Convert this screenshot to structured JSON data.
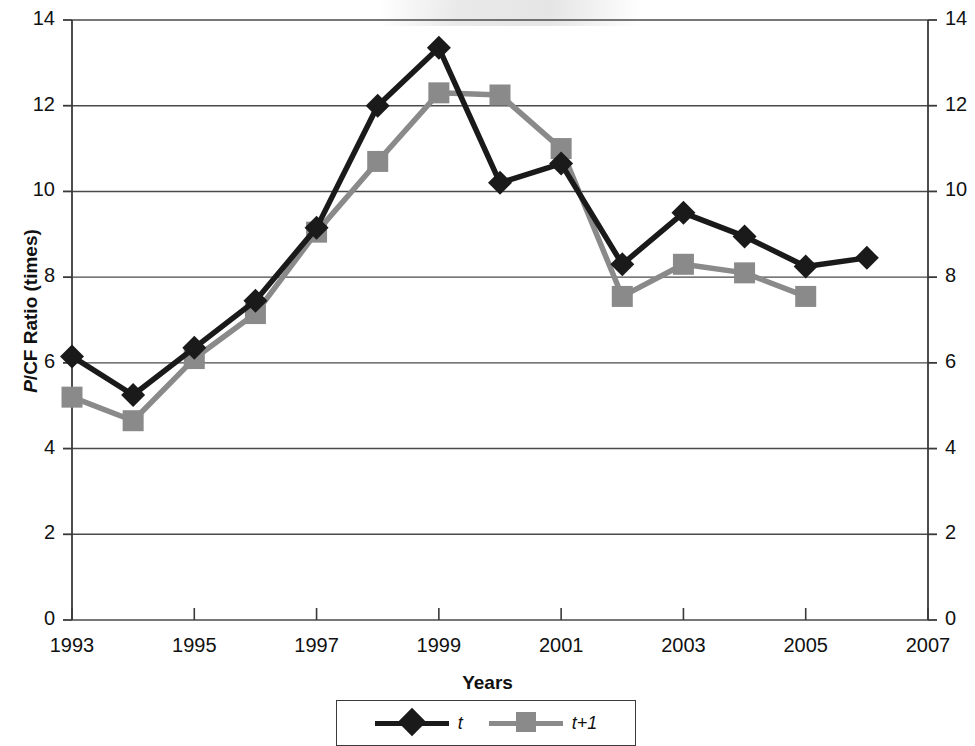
{
  "chart_data": {
    "type": "line",
    "title": "",
    "xlabel": "Years",
    "ylabel": "P/CF Ratio (times)",
    "ylabel_italic_prefix": "P",
    "ylabel_rest": "/CF Ratio (times)",
    "xlim": [
      1993,
      2007
    ],
    "ylim": [
      0,
      14
    ],
    "x_ticks": [
      1993,
      1995,
      1997,
      1999,
      2001,
      2003,
      2005,
      2007
    ],
    "x_tick_labels": [
      "1993",
      "1995",
      "1997",
      "1999",
      "2001",
      "2003",
      "2005",
      "2007"
    ],
    "y_ticks": [
      0,
      2,
      4,
      6,
      8,
      10,
      12,
      14
    ],
    "y_tick_labels": [
      "0",
      "2",
      "4",
      "6",
      "8",
      "10",
      "12",
      "14"
    ],
    "y_ticks_right": [
      0,
      2,
      4,
      6,
      8,
      10,
      12,
      14
    ],
    "y_tick_labels_right": [
      "0",
      "2",
      "4",
      "6",
      "8",
      "10",
      "12",
      "14"
    ],
    "grid": true,
    "grid_axis": "y",
    "legend_position": "bottom-center",
    "x": [
      1993,
      1994,
      1995,
      1996,
      1997,
      1998,
      1999,
      2000,
      2001,
      2002,
      2003,
      2004,
      2005,
      2006
    ],
    "series": [
      {
        "name": "t",
        "color": "#1a1a1a",
        "marker": "diamond",
        "x": [
          1993,
          1994,
          1995,
          1996,
          1997,
          1998,
          1999,
          2000,
          2001,
          2002,
          2003,
          2004,
          2005,
          2006
        ],
        "values": [
          6.15,
          5.25,
          6.35,
          7.45,
          9.15,
          12.0,
          13.35,
          10.2,
          10.65,
          8.3,
          9.5,
          8.95,
          8.25,
          8.45
        ]
      },
      {
        "name": "t+1",
        "color": "#8a8a8a",
        "marker": "square",
        "x": [
          1993,
          1994,
          1995,
          1996,
          1997,
          1998,
          1999,
          2000,
          2001,
          2002,
          2003,
          2004,
          2005
        ],
        "values": [
          5.2,
          4.65,
          6.1,
          7.15,
          9.05,
          10.7,
          12.3,
          12.25,
          11.0,
          7.55,
          8.3,
          8.1,
          7.55
        ]
      }
    ]
  },
  "legend": {
    "items": [
      {
        "label": "t",
        "color": "#1a1a1a",
        "marker": "diamond"
      },
      {
        "label": "t+1",
        "color": "#8a8a8a",
        "marker": "square"
      }
    ]
  },
  "colors": {
    "series_t": "#1a1a1a",
    "series_t1": "#8a8a8a",
    "axis": "#3a3a3a",
    "grid": "#4a4a4a",
    "text": "#111111",
    "background": "#ffffff"
  }
}
